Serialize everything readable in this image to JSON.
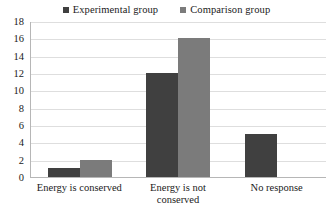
{
  "chart_data": {
    "type": "bar",
    "title": "",
    "subtitle": "",
    "xlabel": "",
    "ylabel": "",
    "categories": [
      "Energy is conserved",
      "Energy is not conserved",
      "No response"
    ],
    "series": [
      {
        "name": "Experimental group",
        "color": "#404040",
        "values": [
          1,
          12,
          5
        ]
      },
      {
        "name": "Comparison group",
        "color": "#7B7B7B",
        "values": [
          2,
          16,
          0
        ]
      }
    ],
    "ylim": [
      0,
      18
    ],
    "ytick_step": 2,
    "yticks": [
      "0",
      "2",
      "4",
      "6",
      "8",
      "10",
      "12",
      "14",
      "16",
      "18"
    ],
    "grid": true,
    "grid_axis": "y",
    "legend_position": "top-center",
    "axis_color": "#B6B6B6",
    "gridline_color": "#DEDEDE",
    "background": "#FFFFFF"
  },
  "legend": {
    "entries": [
      {
        "label": "Experimental group",
        "swatch_name": "legend-swatch-experimental"
      },
      {
        "label": "Comparison group",
        "swatch_name": "legend-swatch-comparison"
      }
    ]
  }
}
